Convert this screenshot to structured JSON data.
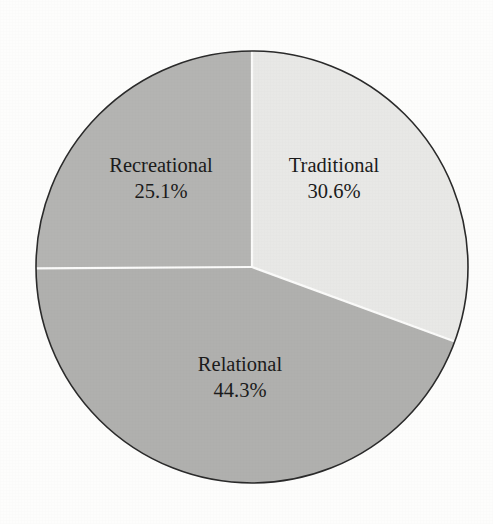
{
  "chart_data": {
    "type": "pie",
    "title": "",
    "subtitle": "",
    "xlabel": "",
    "ylabel": "",
    "legend": "none",
    "grid": false,
    "units": "percent",
    "label_format": "name above value, value with one decimal and percent sign",
    "start_angle_deg": 0,
    "direction": "clockwise",
    "categories": [
      "Traditional",
      "Relational",
      "Recreational"
    ],
    "values": [
      30.6,
      44.3,
      25.1
    ],
    "slices": [
      {
        "label": "Traditional",
        "value": 30.6,
        "value_text": "30.6%",
        "color": "#e8e8e6",
        "start_angle_deg": 0.0,
        "end_angle_deg": 110.16,
        "label_x": 334,
        "label_y": 172,
        "value_x": 334,
        "value_y": 198
      },
      {
        "label": "Relational",
        "value": 44.3,
        "value_text": "44.3%",
        "color": "#b0b0ae",
        "start_angle_deg": 110.16,
        "end_angle_deg": 269.64,
        "label_x": 240,
        "label_y": 371,
        "value_x": 240,
        "value_y": 397
      },
      {
        "label": "Recreational",
        "value": 25.1,
        "value_text": "25.1%",
        "color": "#b4b4b2",
        "start_angle_deg": 269.64,
        "end_angle_deg": 360.0,
        "label_x": 161,
        "label_y": 172,
        "value_x": 161,
        "value_y": 198
      }
    ],
    "geometry": {
      "center_x": 252,
      "center_y": 267,
      "radius": 216
    },
    "style": {
      "background": "#fdfdfc",
      "outline_color": "#2a2a2a",
      "outline_width": 1.6,
      "divider_color": "#fbfbfa",
      "divider_width": 2.2,
      "text_color": "#1b1b1b"
    }
  }
}
